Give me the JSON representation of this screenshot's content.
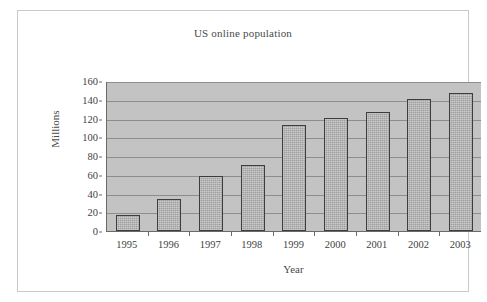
{
  "chart_data": {
    "type": "bar",
    "title": "US online population",
    "xlabel": "Year",
    "ylabel": "Millions",
    "categories": [
      "1995",
      "1996",
      "1997",
      "1998",
      "1999",
      "2000",
      "2001",
      "2002",
      "2003"
    ],
    "values": [
      17,
      34,
      59,
      70,
      113,
      121,
      127,
      141,
      147
    ],
    "ylim": [
      0,
      160
    ],
    "yticks": [
      0,
      20,
      40,
      60,
      80,
      100,
      120,
      140,
      160
    ],
    "ytick_labels": [
      "0",
      "20",
      "40",
      "60",
      "80",
      "100",
      "120",
      "140",
      "160"
    ],
    "grid": true,
    "legend": false,
    "series": [
      {
        "name": "US online population",
        "values": [
          17,
          34,
          59,
          70,
          113,
          121,
          127,
          141,
          147
        ]
      }
    ],
    "colors": {
      "bar_fill": "#9f9f9f",
      "bar_border": "#3d3d3d",
      "plot_background": "#c3c3c3",
      "gridline": "#8d8d8d",
      "axis": "#6a6a6a",
      "text": "#3f3f3f",
      "frame": "#c9c9c9",
      "figure_background": "#ffffff"
    }
  }
}
